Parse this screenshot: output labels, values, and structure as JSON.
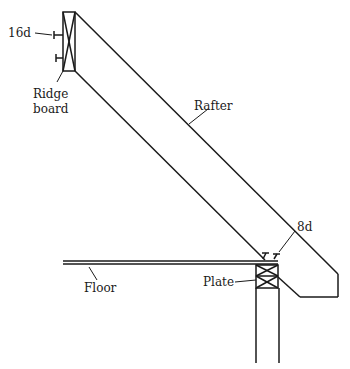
{
  "diagram": {
    "type": "roof rafter framing detail",
    "labels": {
      "nail_ridge": "16d",
      "ridge_1": "Ridge",
      "ridge_2": "board",
      "rafter": "Rafter",
      "nail_plate": "8d",
      "floor": "Floor",
      "plate": "Plate"
    },
    "colors": {
      "line": "#1a1a1a",
      "background": "#ffffff"
    }
  }
}
